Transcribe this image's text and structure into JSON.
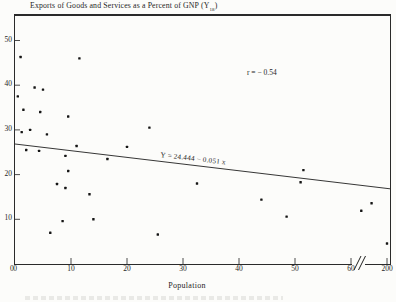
{
  "figure": {
    "title_main": "Exports of Goods and Services as a Percent of GNP (Y",
    "title_sub": "18",
    "title_close": ")",
    "correlation_label": "r = − 0.54",
    "equation_label": "Y = 24.444 − 0.051 x",
    "x_axis_title": "Population",
    "origin_label": "0",
    "ink_color": "#1f1f1f",
    "background_color": "#fcfcfa"
  },
  "chart_data": {
    "type": "scatter",
    "xlabel": "Population",
    "ylabel": "Exports of Goods and Services as a Percent of GNP",
    "x_ticks": [
      0,
      10,
      20,
      30,
      40,
      50,
      60,
      200
    ],
    "x_axis_break_between": [
      60,
      200
    ],
    "y_ticks": [
      10,
      20,
      30,
      40,
      50
    ],
    "ylim": [
      0,
      53
    ],
    "grid": false,
    "legend": "none",
    "annotations": [
      "r = − 0.54",
      "Y = 24.444 − 0.051 x"
    ],
    "regression_line": {
      "equation": "Y = 24.444 − 0.051 x",
      "intercept": 24.444,
      "slope": -0.051
    },
    "correlation_r": -0.54,
    "points": [
      [
        1,
        46.3
      ],
      [
        11.5,
        46
      ],
      [
        0.5,
        37.5
      ],
      [
        3.5,
        39.5
      ],
      [
        5,
        39
      ],
      [
        1.5,
        34.5
      ],
      [
        4.5,
        34
      ],
      [
        9.5,
        33
      ],
      [
        24,
        30.5
      ],
      [
        1.2,
        29.5
      ],
      [
        2.7,
        30
      ],
      [
        5.7,
        29
      ],
      [
        2,
        25.5
      ],
      [
        4.3,
        25.3
      ],
      [
        11,
        26.4
      ],
      [
        9,
        24.2
      ],
      [
        20,
        26.2
      ],
      [
        16.5,
        23.5
      ],
      [
        9.5,
        20.8
      ],
      [
        7.5,
        17.9
      ],
      [
        9,
        17
      ],
      [
        13.3,
        15.6
      ],
      [
        32.5,
        18
      ],
      [
        8.5,
        9.6
      ],
      [
        14,
        10
      ],
      [
        6.3,
        7
      ],
      [
        25.5,
        6.6
      ],
      [
        51.5,
        21
      ],
      [
        51,
        18.3
      ],
      [
        44,
        14.4
      ],
      [
        140,
        13.6
      ],
      [
        100,
        11.9
      ],
      [
        48.5,
        10.6
      ],
      [
        200,
        4.6
      ]
    ]
  }
}
